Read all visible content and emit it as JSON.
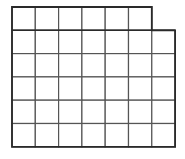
{
  "diagram": {
    "type": "grid",
    "rows": [
      {
        "cells": 6
      },
      {
        "cells": 7
      },
      {
        "cells": 7
      },
      {
        "cells": 7
      },
      {
        "cells": 7
      },
      {
        "cells": 7
      }
    ],
    "total_cells": 41,
    "cell_size_px": 23.3,
    "origin": {
      "x": 12,
      "y": 7
    },
    "colors": {
      "outer_line": "#2a2a2a",
      "inner_line": "#555555",
      "background": "#ffffff"
    }
  }
}
